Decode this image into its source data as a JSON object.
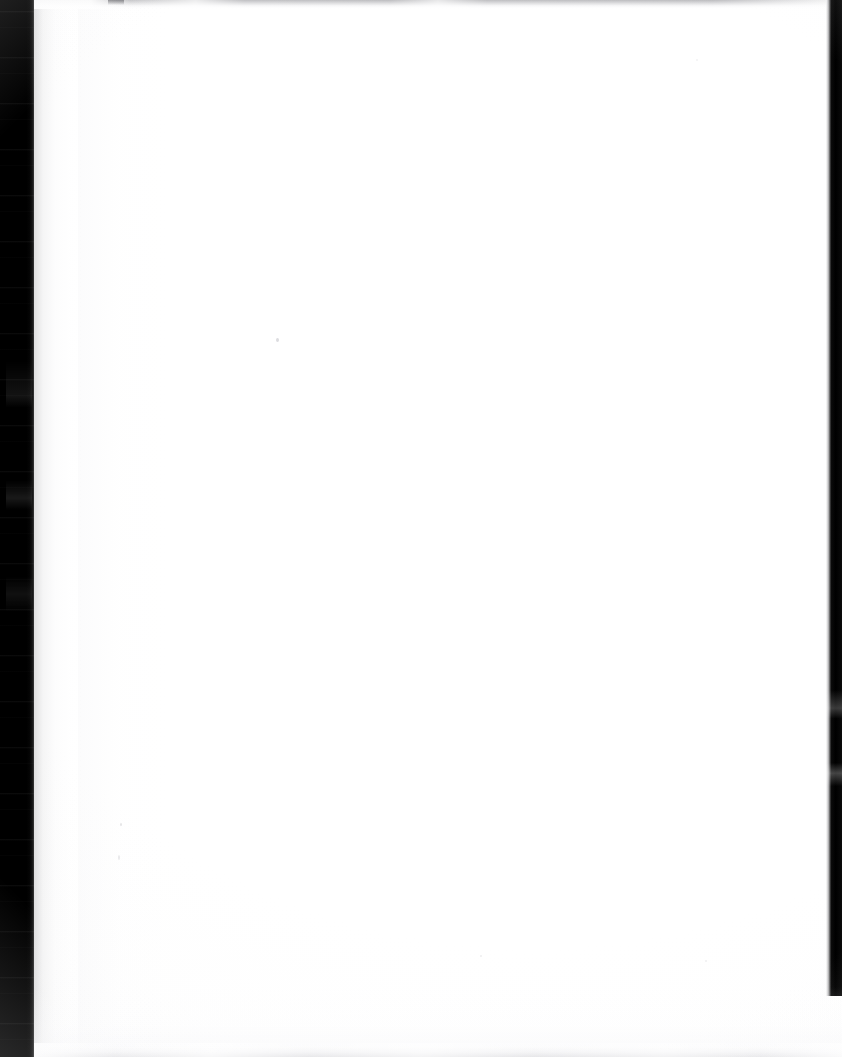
{
  "document": {
    "kind": "scanned-page",
    "page_state": "blank",
    "visible_text": "",
    "width_px": 842,
    "height_px": 1057
  },
  "page": {
    "background_color": "#ffffff",
    "content_text": ""
  },
  "artifacts": {
    "binding_gutter": {
      "name": "left-binding-gutter",
      "color": "#000000",
      "x_px": 0,
      "width_px": 34,
      "description": "black scanner gutter shadow along the left spine"
    },
    "page_edge_shadow": {
      "name": "page-edge-shadow",
      "color": "#96969a",
      "x_px": 34,
      "width_px": 50,
      "description": "soft grey falloff where the sheet curves into the spine"
    },
    "top_streaks": {
      "name": "top-scan-streaks",
      "color": "#78787e",
      "y_px": 0,
      "height_px": 9,
      "description": "irregular dark horizontal scanner streaks across the top edge"
    },
    "right_edge_strip": {
      "name": "right-dark-edge-strip",
      "color": "#000000",
      "x_px": 826,
      "width_px": 16,
      "height_px": 996,
      "description": "thin black strip along the right edge, stopping short of the bottom"
    },
    "bottom_streaks": {
      "name": "bottom-scan-streaks",
      "color": "#bcbcc1",
      "height_px": 14,
      "description": "faint grey streak band along the bottom edge"
    },
    "specks": {
      "name": "dust-specks",
      "color": "#a8a8ae",
      "count": 6,
      "description": "scattered faint dust specks on the blank page"
    }
  }
}
